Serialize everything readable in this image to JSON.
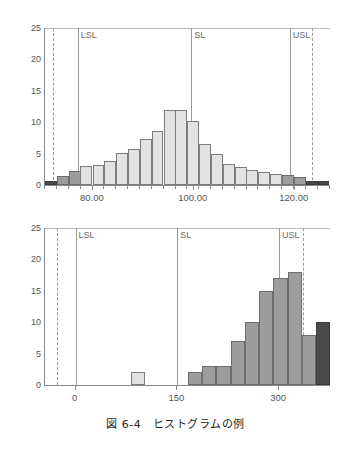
{
  "caption": "図 6-4　ヒストグラムの例",
  "colors": {
    "bar_light": "#e2e2e2",
    "bar_mid": "#9d9d9d",
    "bar_dark": "#4a4a4a",
    "bar_border": "#7d7d7d",
    "axis": "#8a8a8a",
    "spec_line": "#9a9a9a",
    "text": "#555555"
  },
  "chart_data": [
    {
      "id": "histogram-top",
      "type": "bar",
      "title": "",
      "xlabel": "",
      "ylabel": "",
      "ylim": [
        0,
        25
      ],
      "yticks": [
        0,
        5,
        10,
        15,
        20,
        25
      ],
      "ytick_labels": [
        "0",
        "5",
        "10",
        "15",
        "20",
        "25"
      ],
      "xlim": [
        70.5,
        127.0
      ],
      "xticks": [
        80,
        100,
        120
      ],
      "xtick_labels": [
        "80.00",
        "100.00",
        "120.00"
      ],
      "grid": false,
      "legend": null,
      "annotations": [
        {
          "label": "LSL",
          "x": 77.0,
          "style": "solid"
        },
        {
          "label": "SL",
          "x": 99.5,
          "style": "solid"
        },
        {
          "label": "USL",
          "x": 119.0,
          "style": "solid"
        },
        {
          "label": "",
          "x": 72.0,
          "style": "dashed"
        },
        {
          "label": "",
          "x": 123.5,
          "style": "dashed"
        }
      ],
      "bin_width": 2.35,
      "bins": [
        {
          "x": 71.7,
          "value": 0.6,
          "shade": "dark"
        },
        {
          "x": 74.0,
          "value": 1.5,
          "shade": "mid"
        },
        {
          "x": 76.4,
          "value": 2.2,
          "shade": "mid"
        },
        {
          "x": 78.7,
          "value": 3.0,
          "shade": "light"
        },
        {
          "x": 81.1,
          "value": 3.2,
          "shade": "light"
        },
        {
          "x": 83.4,
          "value": 3.8,
          "shade": "light"
        },
        {
          "x": 85.8,
          "value": 5.1,
          "shade": "light"
        },
        {
          "x": 88.1,
          "value": 5.7,
          "shade": "light"
        },
        {
          "x": 90.5,
          "value": 7.3,
          "shade": "light"
        },
        {
          "x": 92.8,
          "value": 8.6,
          "shade": "light"
        },
        {
          "x": 95.2,
          "value": 12.0,
          "shade": "light"
        },
        {
          "x": 97.5,
          "value": 12.0,
          "shade": "light"
        },
        {
          "x": 99.9,
          "value": 10.2,
          "shade": "light"
        },
        {
          "x": 102.2,
          "value": 6.5,
          "shade": "light"
        },
        {
          "x": 104.6,
          "value": 5.0,
          "shade": "light"
        },
        {
          "x": 106.9,
          "value": 3.3,
          "shade": "light"
        },
        {
          "x": 109.3,
          "value": 2.9,
          "shade": "light"
        },
        {
          "x": 111.6,
          "value": 2.4,
          "shade": "light"
        },
        {
          "x": 114.0,
          "value": 2.0,
          "shade": "light"
        },
        {
          "x": 116.3,
          "value": 1.7,
          "shade": "light"
        },
        {
          "x": 118.7,
          "value": 1.6,
          "shade": "mid"
        },
        {
          "x": 121.0,
          "value": 1.2,
          "shade": "mid"
        },
        {
          "x": 123.4,
          "value": 0.7,
          "shade": "dark"
        },
        {
          "x": 125.7,
          "value": 0.7,
          "shade": "dark"
        }
      ]
    },
    {
      "id": "histogram-bottom",
      "type": "bar",
      "title": "",
      "xlabel": "",
      "ylabel": "",
      "ylim": [
        0,
        25
      ],
      "yticks": [
        0,
        5,
        10,
        15,
        20,
        25
      ],
      "ytick_labels": [
        "0",
        "5",
        "10",
        "15",
        "20",
        "25"
      ],
      "xlim": [
        -45,
        375
      ],
      "xticks": [
        0,
        150,
        300
      ],
      "xtick_labels": [
        "0",
        "150",
        "300"
      ],
      "grid": false,
      "legend": null,
      "annotations": [
        {
          "label": "LSL",
          "x": 0,
          "style": "solid"
        },
        {
          "label": "SL",
          "x": 150,
          "style": "solid"
        },
        {
          "label": "USL",
          "x": 300,
          "style": "solid"
        },
        {
          "label": "",
          "x": -27,
          "style": "dashed"
        },
        {
          "label": "",
          "x": 335,
          "style": "dashed"
        }
      ],
      "bin_width": 21,
      "bins": [
        {
          "x": 92,
          "value": 2,
          "shade": "light"
        },
        {
          "x": 176,
          "value": 2,
          "shade": "mid"
        },
        {
          "x": 197,
          "value": 3,
          "shade": "mid"
        },
        {
          "x": 218,
          "value": 3,
          "shade": "mid"
        },
        {
          "x": 239,
          "value": 7,
          "shade": "mid"
        },
        {
          "x": 260,
          "value": 10,
          "shade": "mid"
        },
        {
          "x": 281,
          "value": 15,
          "shade": "mid"
        },
        {
          "x": 302,
          "value": 17,
          "shade": "mid"
        },
        {
          "x": 323,
          "value": 18,
          "shade": "mid"
        },
        {
          "x": 344,
          "value": 8,
          "shade": "mid"
        },
        {
          "x": 365,
          "value": 10,
          "shade": "dark"
        }
      ]
    }
  ]
}
